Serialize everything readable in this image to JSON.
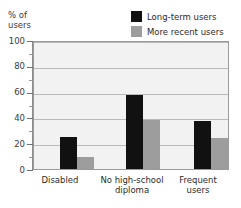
{
  "chart_data": {
    "type": "bar",
    "title": "",
    "xlabel": "",
    "ylabel": "% of\nusers",
    "ylim": [
      0,
      100
    ],
    "ytick_values": [
      0,
      20,
      40,
      60,
      80,
      100
    ],
    "ytick_labels": [
      "0",
      "20",
      "40",
      "60",
      "80",
      "100"
    ],
    "yminor_values": [
      10,
      30,
      50,
      70,
      90
    ],
    "grid": true,
    "grid_axis": "y",
    "legend_position": "top-right",
    "categories": [
      "Disabled",
      "No high-school\ndiploma",
      "Frequent\nusers"
    ],
    "series": [
      {
        "name": "Long-term users",
        "color": "#111111",
        "values": [
          25,
          57,
          37
        ]
      },
      {
        "name": "More recent users",
        "color": "#9d9d9d",
        "values": [
          9,
          38,
          24
        ]
      }
    ]
  },
  "legend": {
    "items": [
      {
        "label": "Long-term users",
        "swatch": "#111111"
      },
      {
        "label": "More recent users",
        "swatch": "#9d9d9d"
      }
    ]
  },
  "axes": {
    "y_caption": "% of\nusers",
    "y_labels": [
      "100",
      "80",
      "60",
      "40",
      "20",
      "0"
    ],
    "x_labels": [
      "Disabled",
      "No high-school\ndiploma",
      "Frequent\nusers"
    ]
  },
  "colors": {
    "series_dark": "#111111",
    "series_light": "#9d9d9d",
    "plot_background": "#f2f2f2",
    "gridline": "#b9b9b9",
    "frame": "#9a9a9a"
  }
}
